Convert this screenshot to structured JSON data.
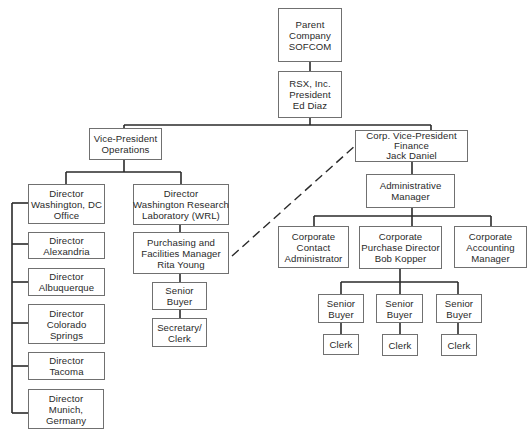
{
  "chart_title": "",
  "nodes": {
    "parent": {
      "lines": [
        "Parent",
        "Company",
        "SOFCOM"
      ]
    },
    "rsx": {
      "lines": [
        "RSX, Inc.",
        "President",
        "Ed Diaz"
      ]
    },
    "vp_ops": {
      "lines": [
        "Vice-President",
        "Operations"
      ]
    },
    "vp_fin": {
      "lines": [
        "Corp. Vice-President",
        "Finance",
        "Jack Daniel"
      ]
    },
    "dir_dc": {
      "lines": [
        "Director",
        "Washington, DC",
        "Office"
      ]
    },
    "dir_alex": {
      "lines": [
        "Director",
        "Alexandria"
      ]
    },
    "dir_albq": {
      "lines": [
        "Director",
        "Albuquerque"
      ]
    },
    "dir_colo": {
      "lines": [
        "Director",
        "Colorado",
        "Springs"
      ]
    },
    "dir_tacoma": {
      "lines": [
        "Director",
        "Tacoma"
      ]
    },
    "dir_munich": {
      "lines": [
        "Director",
        "Munich,",
        "Germany"
      ]
    },
    "dir_wrl": {
      "lines": [
        "Director",
        "Washington Research",
        "Laboratory (WRL)"
      ]
    },
    "purch_mgr": {
      "lines": [
        "Purchasing and",
        "Facilities Manager",
        "Rita Young"
      ]
    },
    "wrl_buyer": {
      "lines": [
        "Senior",
        "Buyer"
      ]
    },
    "wrl_clerk": {
      "lines": [
        "Secretary/",
        "Clerk"
      ]
    },
    "admin_mgr": {
      "lines": [
        "Administrative",
        "Manager"
      ]
    },
    "contact_admin": {
      "lines": [
        "Corporate",
        "Contact",
        "Administrator"
      ]
    },
    "purch_dir": {
      "lines": [
        "Corporate",
        "Purchase Director",
        "Bob Kopper"
      ]
    },
    "acct_mgr": {
      "lines": [
        "Corporate",
        "Accounting",
        "Manager"
      ]
    },
    "buyer1": {
      "lines": [
        "Senior",
        "Buyer"
      ]
    },
    "buyer2": {
      "lines": [
        "Senior",
        "Buyer"
      ]
    },
    "buyer3": {
      "lines": [
        "Senior",
        "Buyer"
      ]
    },
    "clerk1": {
      "lines": [
        "Clerk"
      ]
    },
    "clerk2": {
      "lines": [
        "Clerk"
      ]
    },
    "clerk3": {
      "lines": [
        "Clerk"
      ]
    }
  },
  "edges": [
    [
      "parent",
      "rsx"
    ],
    [
      "rsx",
      "vp_ops"
    ],
    [
      "rsx",
      "vp_fin"
    ],
    [
      "vp_ops",
      "dir_dc"
    ],
    [
      "vp_ops",
      "dir_wrl"
    ],
    [
      "dir_dc",
      "dir_alex"
    ],
    [
      "dir_dc",
      "dir_albq"
    ],
    [
      "dir_dc",
      "dir_colo"
    ],
    [
      "dir_dc",
      "dir_tacoma"
    ],
    [
      "dir_dc",
      "dir_munich"
    ],
    [
      "dir_wrl",
      "purch_mgr"
    ],
    [
      "purch_mgr",
      "wrl_buyer"
    ],
    [
      "wrl_buyer",
      "wrl_clerk"
    ],
    [
      "vp_fin",
      "admin_mgr"
    ],
    [
      "admin_mgr",
      "contact_admin"
    ],
    [
      "admin_mgr",
      "purch_dir"
    ],
    [
      "admin_mgr",
      "acct_mgr"
    ],
    [
      "purch_dir",
      "buyer1"
    ],
    [
      "purch_dir",
      "buyer2"
    ],
    [
      "purch_dir",
      "buyer3"
    ],
    [
      "buyer1",
      "clerk1"
    ],
    [
      "buyer2",
      "clerk2"
    ],
    [
      "buyer3",
      "clerk3"
    ]
  ],
  "dotted_edges": [
    [
      "purch_mgr",
      "vp_fin"
    ]
  ],
  "colors": {
    "line": "#2a2a2a",
    "border": "#707070",
    "text": "#2a2a2a"
  }
}
